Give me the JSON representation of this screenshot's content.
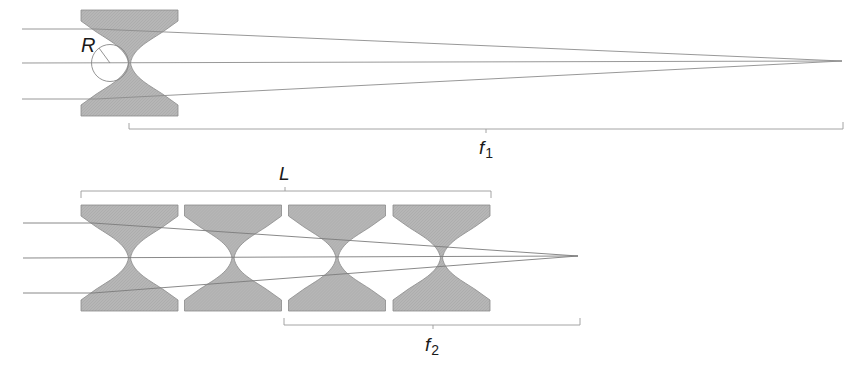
{
  "figure": {
    "colors": {
      "lens_fill": "#b4b4b4",
      "lens_stroke": "#8a8a8a",
      "ray": "#8c8c8c",
      "bracket": "#9a9a9a",
      "text": "#1a1a1a"
    }
  },
  "top_panel": {
    "radius_label": "R",
    "focal_label": "f",
    "focal_subscript": "1",
    "lens_count": 1,
    "rays_y": [
      29,
      63,
      99
    ],
    "focal_point": [
      842,
      61
    ]
  },
  "bottom_panel": {
    "length_label": "L",
    "focal_label": "f",
    "focal_subscript": "2",
    "lens_count": 4,
    "rays_y": [
      223,
      258,
      293
    ],
    "focal_point": [
      578,
      256
    ]
  }
}
